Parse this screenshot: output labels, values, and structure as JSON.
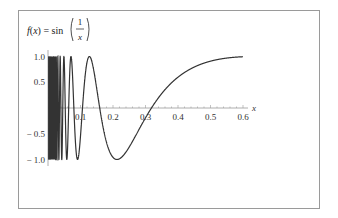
{
  "chart_data": {
    "type": "line",
    "title_parts": {
      "lhs": "f(x) = sin",
      "numerator": "1",
      "denominator": "x"
    },
    "xlabel": "x",
    "ylabel": "",
    "xlim": [
      0,
      0.6
    ],
    "ylim": [
      -1.0,
      1.0
    ],
    "x_ticks": [
      "0.1",
      "0.2",
      "0.3",
      "0.4",
      "0.5",
      "0.6"
    ],
    "y_ticks": [
      "1.0",
      "0.5",
      "-0.5",
      "-1.0"
    ],
    "grid": false,
    "legend": null,
    "series": [
      {
        "name": "sin(1/x)",
        "function": "sin(1/x)",
        "color": "#333333",
        "x": [
          0.02,
          0.05,
          0.0637,
          0.08,
          0.1,
          0.1061,
          0.15,
          0.2122,
          0.25,
          0.3183,
          0.35,
          0.4,
          0.45,
          0.5,
          0.55,
          0.6
        ],
        "y": [
          -0.26,
          0.91,
          1.0,
          -0.13,
          -0.54,
          -1.0,
          0.99,
          -1.0,
          -0.76,
          0.0,
          0.28,
          0.6,
          0.8,
          0.91,
          0.97,
          0.995
        ]
      }
    ]
  },
  "colors": {
    "curve": "#333333",
    "axis": "#9a9a9a",
    "frame": "#9a9a9a"
  }
}
